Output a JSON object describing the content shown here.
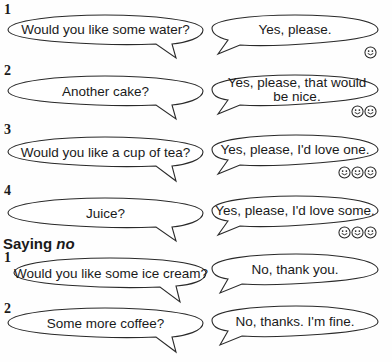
{
  "section_yes": {
    "items": [
      {
        "number": "1",
        "offer": "Would you like some water?",
        "reply": "Yes, please.",
        "smiley_count": 1
      },
      {
        "number": "2",
        "offer": "Another cake?",
        "reply": "Yes, please, that would be nice.",
        "smiley_count": 2
      },
      {
        "number": "3",
        "offer": "Would you like a cup of tea?",
        "reply": "Yes, please, I'd love one.",
        "smiley_count": 3
      },
      {
        "number": "4",
        "offer": "Juice?",
        "reply": "Yes, please, I'd love some.",
        "smiley_count": 3
      }
    ]
  },
  "section_no": {
    "heading_prefix": "Saying ",
    "heading_emphasis": "no",
    "items": [
      {
        "number": "1",
        "offer": "Would you like some ice cream?",
        "reply": "No, thank you."
      },
      {
        "number": "2",
        "offer": "Some more coffee?",
        "reply": "No, thanks. I'm fine."
      }
    ]
  },
  "icons": {
    "smiley": "smiley-face-icon"
  },
  "colors": {
    "ink": "#1a1a1a",
    "bubble_fill": "#ffffff",
    "background": "#fefefe"
  }
}
